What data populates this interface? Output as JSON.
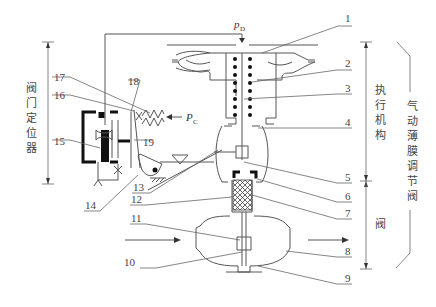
{
  "diagram": {
    "title": "气动薄膜调节阀",
    "type": "pneumatic diaphragm control valve with valve positioner",
    "signals": {
      "output_pressure": {
        "symbol": "p",
        "subscript": "D"
      },
      "control_pressure": {
        "symbol": "P",
        "subscript": "C"
      }
    },
    "sections": {
      "positioner": "阀门定位器",
      "actuator": "执行机构",
      "valve": "阀",
      "whole": "气动薄膜调节阀"
    },
    "callouts": [
      {
        "n": "1",
        "label": "1"
      },
      {
        "n": "2",
        "label": "2"
      },
      {
        "n": "3",
        "label": "3"
      },
      {
        "n": "4",
        "label": "4"
      },
      {
        "n": "5",
        "label": "5"
      },
      {
        "n": "6",
        "label": "6"
      },
      {
        "n": "7",
        "label": "7"
      },
      {
        "n": "8",
        "label": "8"
      },
      {
        "n": "9",
        "label": "9"
      },
      {
        "n": "10",
        "label": "10"
      },
      {
        "n": "11",
        "label": "11"
      },
      {
        "n": "12",
        "label": "12"
      },
      {
        "n": "13",
        "label": "13"
      },
      {
        "n": "14",
        "label": "14"
      },
      {
        "n": "15",
        "label": "15"
      },
      {
        "n": "16",
        "label": "16"
      },
      {
        "n": "17",
        "label": "17"
      },
      {
        "n": "18",
        "label": "18"
      },
      {
        "n": "19",
        "label": "19"
      }
    ]
  }
}
